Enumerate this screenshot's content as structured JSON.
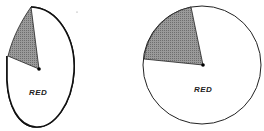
{
  "figures": [
    {
      "id": "oblique-pie",
      "label": "RED",
      "shaded_sector_color": "#8a8a8a",
      "outline_color": "#111111"
    },
    {
      "id": "frontal-pie",
      "label": "RED",
      "shaded_sector_color": "#8a8a8a",
      "outline_color": "#111111"
    }
  ]
}
